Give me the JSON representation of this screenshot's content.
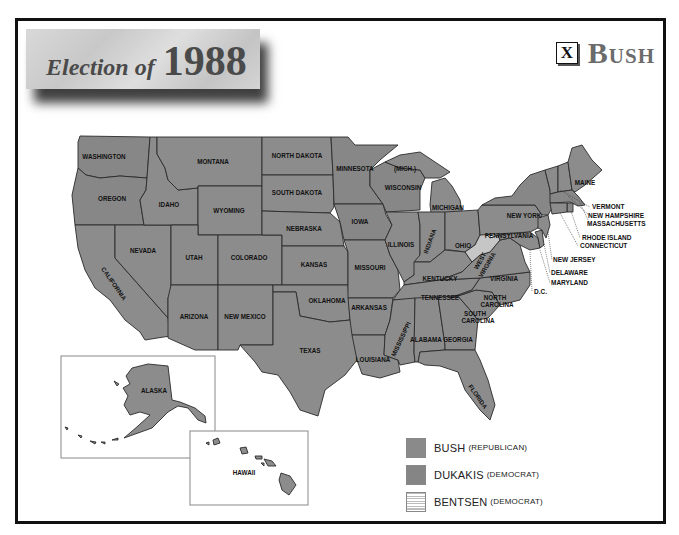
{
  "title": {
    "lead": "Election of",
    "year": "1988"
  },
  "winner": {
    "mark": "X",
    "name": "Bush"
  },
  "colors": {
    "bush": "#8a8a8a",
    "dukakis": "#858585",
    "bentsen": "#e6e6e6",
    "frame": "#111111",
    "background": "#ffffff"
  },
  "states": {
    "washington": "WASHINGTON",
    "oregon": "OREGON",
    "california": "CALIFORNIA",
    "nevada": "NEVADA",
    "idaho": "IDAHO",
    "montana": "MONTANA",
    "wyoming": "WYOMING",
    "utah": "UTAH",
    "colorado": "COLORADO",
    "arizona": "ARIZONA",
    "new_mexico": "NEW MEXICO",
    "north_dakota": "NORTH DAKOTA",
    "south_dakota": "SOUTH DAKOTA",
    "nebraska": "NEBRASKA",
    "kansas": "KANSAS",
    "oklahoma": "OKLAHOMA",
    "texas": "TEXAS",
    "minnesota": "MINNESOTA",
    "iowa": "IOWA",
    "missouri": "MISSOURI",
    "arkansas": "ARKANSAS",
    "louisiana": "LOUISIANA",
    "wisconsin": "WISCONSIN",
    "michigan": "MICHIGAN",
    "mich_up": "(MICH.)",
    "illinois": "ILLINOIS",
    "indiana": "INDIANA",
    "ohio": "OHIO",
    "kentucky": "KENTUCKY",
    "tennessee": "TENNESSEE",
    "mississippi": "MISSISSIPPI",
    "alabama": "ALABAMA",
    "georgia": "GEORGIA",
    "florida": "FLORIDA",
    "south_carolina_1": "SOUTH",
    "south_carolina_2": "CAROLINA",
    "north_carolina_1": "NORTH",
    "north_carolina_2": "CAROLINA",
    "virginia": "VIRGINIA",
    "west_virginia_1": "WEST",
    "west_virginia_2": "VIRGINIA",
    "pennsylvania": "PENNSYLVANIA",
    "new_york": "NEW YORK",
    "maine": "MAINE",
    "vermont": "VERMONT",
    "new_hampshire": "NEW HAMPSHIRE",
    "massachusetts": "MASSACHUSETTS",
    "rhode_island": "RHODE ISLAND",
    "connecticut": "CONNECTICUT",
    "new_jersey": "NEW JERSEY",
    "delaware": "DELAWARE",
    "maryland": "MARYLAND",
    "dc": "D.C.",
    "alaska": "ALASKA",
    "hawaii": "HAWAII"
  },
  "legend": [
    {
      "name": "BUSH",
      "party": "(REPUBLICAN)"
    },
    {
      "name": "DUKAKIS",
      "party": "(DEMOCRAT)"
    },
    {
      "name": "BENTSEN",
      "party": "(DEMOCRAT)"
    }
  ]
}
